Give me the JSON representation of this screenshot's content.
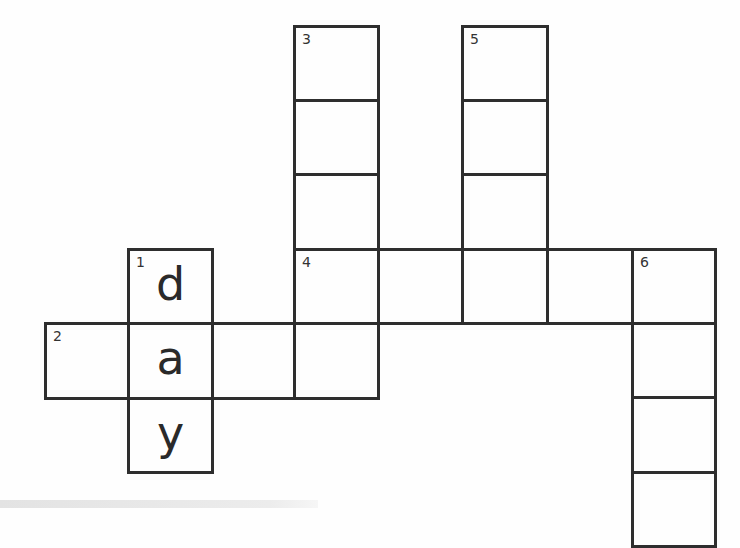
{
  "puzzle": {
    "line_color": "#2e2e2e",
    "cells": [
      {
        "id": "c-3-1",
        "x": 293,
        "y": 25,
        "w": 87,
        "h": 77,
        "number": "3",
        "letter": ""
      },
      {
        "id": "c-3-2",
        "x": 293,
        "y": 99,
        "w": 87,
        "h": 77,
        "number": "",
        "letter": ""
      },
      {
        "id": "c-3-3",
        "x": 293,
        "y": 173,
        "w": 87,
        "h": 78,
        "number": "",
        "letter": ""
      },
      {
        "id": "c-5-1",
        "x": 461,
        "y": 25,
        "w": 88,
        "h": 77,
        "number": "5",
        "letter": ""
      },
      {
        "id": "c-5-2",
        "x": 461,
        "y": 99,
        "w": 88,
        "h": 77,
        "number": "",
        "letter": ""
      },
      {
        "id": "c-5-3",
        "x": 461,
        "y": 173,
        "w": 88,
        "h": 78,
        "number": "",
        "letter": ""
      },
      {
        "id": "c-4-1",
        "x": 293,
        "y": 248,
        "w": 87,
        "h": 77,
        "number": "4",
        "letter": ""
      },
      {
        "id": "c-4-2",
        "x": 377,
        "y": 248,
        "w": 87,
        "h": 77,
        "number": "",
        "letter": ""
      },
      {
        "id": "c-4-3",
        "x": 461,
        "y": 248,
        "w": 88,
        "h": 77,
        "number": "",
        "letter": ""
      },
      {
        "id": "c-4-4",
        "x": 546,
        "y": 248,
        "w": 88,
        "h": 77,
        "number": "",
        "letter": ""
      },
      {
        "id": "c-6-1",
        "x": 631,
        "y": 248,
        "w": 86,
        "h": 77,
        "number": "6",
        "letter": ""
      },
      {
        "id": "c-6-2",
        "x": 631,
        "y": 322,
        "w": 86,
        "h": 77,
        "number": "",
        "letter": ""
      },
      {
        "id": "c-6-3",
        "x": 631,
        "y": 396,
        "w": 86,
        "h": 78,
        "number": "",
        "letter": ""
      },
      {
        "id": "c-6-4",
        "x": 631,
        "y": 471,
        "w": 86,
        "h": 77,
        "number": "",
        "letter": ""
      },
      {
        "id": "c-1-1",
        "x": 127,
        "y": 248,
        "w": 87,
        "h": 77,
        "number": "1",
        "letter": "d"
      },
      {
        "id": "c-2-1",
        "x": 44,
        "y": 322,
        "w": 86,
        "h": 78,
        "number": "2",
        "letter": ""
      },
      {
        "id": "c-2-2",
        "x": 127,
        "y": 322,
        "w": 87,
        "h": 78,
        "number": "",
        "letter": "a"
      },
      {
        "id": "c-2-3",
        "x": 211,
        "y": 322,
        "w": 85,
        "h": 78,
        "number": "",
        "letter": ""
      },
      {
        "id": "c-2-4",
        "x": 293,
        "y": 322,
        "w": 87,
        "h": 78,
        "number": "",
        "letter": ""
      },
      {
        "id": "c-1-3",
        "x": 127,
        "y": 397,
        "w": 87,
        "h": 77,
        "number": "",
        "letter": "y"
      }
    ]
  },
  "words": {
    "1_down": {
      "number": "1",
      "direction": "down",
      "length": 3,
      "filled": "day"
    },
    "2_across": {
      "number": "2",
      "direction": "across",
      "length": 4,
      "filled": "_a__"
    },
    "3_down": {
      "number": "3",
      "direction": "down",
      "length": 5
    },
    "4_across": {
      "number": "4",
      "direction": "across",
      "length": 5
    },
    "5_down": {
      "number": "5",
      "direction": "down",
      "length": 4
    },
    "6_down": {
      "number": "6",
      "direction": "down",
      "length": 4
    }
  }
}
